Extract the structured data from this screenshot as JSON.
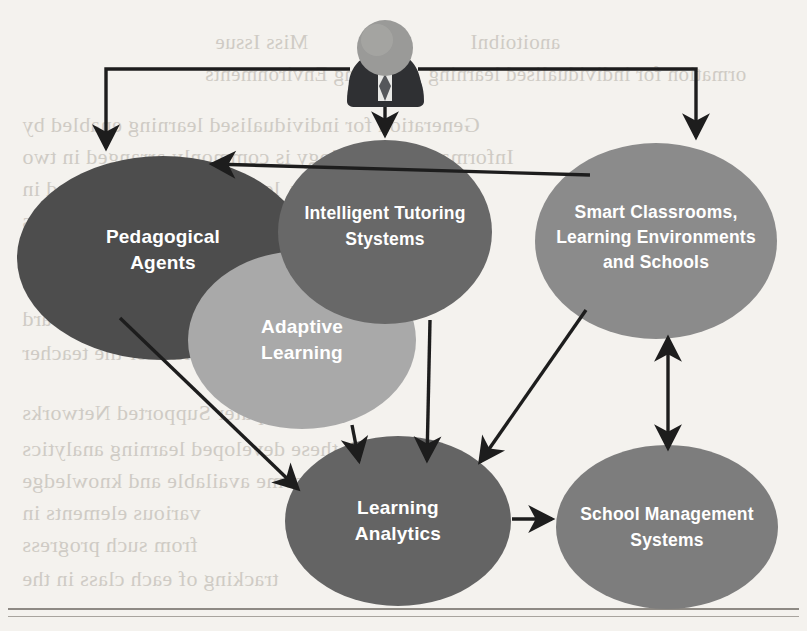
{
  "figure": {
    "background_color": "#f4f2ee",
    "arrow_color": "#1d1d1d"
  },
  "actor": {
    "name": "user-avatar",
    "icon": "person-icon",
    "head_color": "#9a9a98",
    "body_color": "#2f3033",
    "collar_color": "#e8e8e6"
  },
  "nodes": [
    {
      "id": "pedagogical-agents",
      "lines": [
        "Pedagogical",
        "Agents"
      ],
      "color": "#4d4d4d",
      "cx": 163,
      "cy": 258,
      "rx": 146,
      "ry": 102
    },
    {
      "id": "intelligent-tutoring-systems",
      "lines": [
        "Intelligent Tutoring",
        "Stystems"
      ],
      "color": "#686868",
      "cx": 385,
      "cy": 232,
      "rx": 107,
      "ry": 92
    },
    {
      "id": "smart-classrooms",
      "lines": [
        "Smart Classrooms,",
        "Learning Environments",
        "and Schools"
      ],
      "color": "#8b8b8b",
      "cx": 656,
      "cy": 241,
      "rx": 121,
      "ry": 98
    },
    {
      "id": "adaptive-learning",
      "lines": [
        "Adaptive",
        "Learning"
      ],
      "color": "#a9a9a9",
      "cx": 302,
      "cy": 340,
      "rx": 114,
      "ry": 89
    },
    {
      "id": "learning-analytics",
      "lines": [
        "Learning",
        "Analytics"
      ],
      "color": "#646464",
      "cx": 398,
      "cy": 521,
      "rx": 113,
      "ry": 85
    },
    {
      "id": "school-management-systems",
      "lines": [
        "School Management",
        "Systems"
      ],
      "color": "#7d7d7d",
      "cx": 667,
      "cy": 527,
      "rx": 111,
      "ry": 82
    }
  ],
  "edges": [
    {
      "id": "user-to-pedagogical-agents",
      "from": "user",
      "to": "pedagogical-agents",
      "style": "elbow",
      "direction": "single"
    },
    {
      "id": "user-to-intelligent-tutoring-systems",
      "from": "user",
      "to": "intelligent-tutoring-systems",
      "style": "straight",
      "direction": "single"
    },
    {
      "id": "user-to-smart-classrooms",
      "from": "user",
      "to": "smart-classrooms",
      "style": "elbow",
      "direction": "single"
    },
    {
      "id": "smart-classrooms-to-pedagogical-agents",
      "from": "smart-classrooms",
      "to": "pedagogical-agents",
      "style": "diagonal",
      "direction": "single"
    },
    {
      "id": "pedagogical-agents-to-learning-analytics",
      "from": "pedagogical-agents",
      "to": "learning-analytics",
      "style": "diagonal",
      "direction": "single"
    },
    {
      "id": "adaptive-learning-to-learning-analytics",
      "from": "adaptive-learning",
      "to": "learning-analytics",
      "style": "straight",
      "direction": "single"
    },
    {
      "id": "intelligent-tutoring-systems-to-learning-analytics",
      "from": "intelligent-tutoring-systems",
      "to": "learning-analytics",
      "style": "straight",
      "direction": "single"
    },
    {
      "id": "smart-classrooms-to-learning-analytics",
      "from": "smart-classrooms",
      "to": "learning-analytics",
      "style": "diagonal",
      "direction": "single"
    },
    {
      "id": "smart-classrooms-school-management-systems",
      "from": "smart-classrooms",
      "to": "school-management-systems",
      "style": "straight",
      "direction": "bidirectional"
    },
    {
      "id": "learning-analytics-to-school-management-systems",
      "from": "learning-analytics",
      "to": "school-management-systems",
      "style": "straight",
      "direction": "single"
    }
  ],
  "ghost_text": [
    {
      "text": "Miss Issue",
      "x": 215,
      "y": 30,
      "size": 21
    },
    {
      "text": "Learning Environments",
      "x": 205,
      "y": 62,
      "size": 21
    },
    {
      "text": "anoitoibnI",
      "x": 470,
      "y": 30,
      "size": 21
    },
    {
      "text": "ormation for individualised learning",
      "x": 428,
      "y": 62,
      "size": 21
    },
    {
      "text": "Generation for individualised learning enabled by",
      "x": 22,
      "y": 112,
      "size": 22
    },
    {
      "text": "Information technology is commonly arranged in two",
      "x": 22,
      "y": 144,
      "size": 22
    },
    {
      "text": "In this way, learners can be supported in",
      "x": 22,
      "y": 176,
      "size": 22
    },
    {
      "text": "to the learning process as",
      "x": 22,
      "y": 208,
      "size": 22
    },
    {
      "text": "and their own learning",
      "x": 22,
      "y": 240,
      "size": 22
    },
    {
      "text": "analysed and interpreted by",
      "x": 22,
      "y": 272,
      "size": 22
    },
    {
      "text": "presented and visualised in a dashboard",
      "x": 22,
      "y": 306,
      "size": 22
    },
    {
      "text": "to the learner or the teacher",
      "x": 22,
      "y": 340,
      "size": 22
    },
    {
      "text": "omputer Supported Networks",
      "x": 22,
      "y": 400,
      "size": 22
    },
    {
      "text": "With these developed learning analytics",
      "x": 22,
      "y": 436,
      "size": 22
    },
    {
      "text": "become available and knowledge",
      "x": 22,
      "y": 468,
      "size": 22
    },
    {
      "text": "various elements in",
      "x": 22,
      "y": 500,
      "size": 22
    },
    {
      "text": "from such progress",
      "x": 22,
      "y": 532,
      "size": 22
    },
    {
      "text": "tracking of each class in the",
      "x": 22,
      "y": 566,
      "size": 22
    }
  ]
}
